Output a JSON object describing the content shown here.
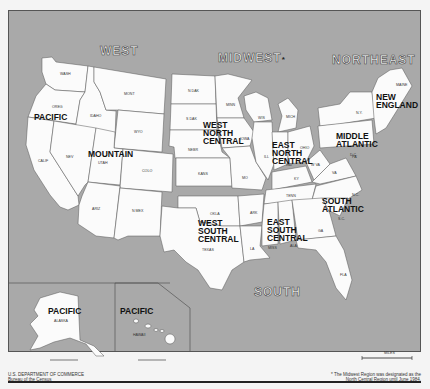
{
  "map": {
    "regions": [
      {
        "name": "WEST"
      },
      {
        "name": "MIDWEST",
        "note_marker": "*"
      },
      {
        "name": "NORTHEAST"
      },
      {
        "name": "SOUTH"
      }
    ],
    "divisions": {
      "pacific": "PACIFIC",
      "mountain": "MOUNTAIN",
      "west_north_central": [
        "WEST",
        "NORTH",
        "CENTRAL"
      ],
      "east_north_central": [
        "EAST",
        "NORTH",
        "CENTRAL"
      ],
      "new_england": [
        "NEW",
        "ENGLAND"
      ],
      "middle_atlantic": [
        "MIDDLE",
        "ATLANTIC"
      ],
      "south_atlantic": [
        "SOUTH",
        "ATLANTIC"
      ],
      "east_south_central": [
        "EAST",
        "SOUTH",
        "CENTRAL"
      ],
      "west_south_central": [
        "WEST",
        "SOUTH",
        "CENTRAL"
      ],
      "pacific_alaska": "PACIFIC",
      "pacific_hawaii": "PACIFIC"
    },
    "states": {
      "wash": "WASH",
      "oreg": "OREG",
      "calif": "CALIF",
      "idaho": "IDAHO",
      "mont": "MONT",
      "wyo": "WYO",
      "nev": "NEV",
      "utah": "UTAH",
      "colo": "COLO",
      "ariz": "ARIZ",
      "nmex": "N MEX",
      "ndak": "N DAK",
      "sdak": "S DAK",
      "nebr": "NEBR",
      "kans": "KANS",
      "minn": "MINN",
      "iowa": "IOWA",
      "mo": "MO",
      "wis": "WIS",
      "mich": "MICH",
      "ill": "ILL",
      "ind": "IND",
      "ohio": "OHIO",
      "ny": "N.Y.",
      "pa": "PA",
      "maine": "MAINE",
      "okla": "OKLA",
      "texas": "TEXAS",
      "ark": "ARK",
      "la": "LA",
      "ky": "KY",
      "tenn": "TENN",
      "miss": "MISS",
      "ala": "ALA",
      "wva": "W VA",
      "va": "VA",
      "nc": "N.C.",
      "sc": "S.C.",
      "ga": "GA",
      "fla": "FLA",
      "dc": "D.C.",
      "alaska": "ALASKA",
      "hawaii": "HAWAII"
    },
    "scale_label": "MILES"
  },
  "footer": {
    "left_line1": "U.S. DEPARTMENT OF COMMERCE",
    "left_line2": "Bureau of the Census",
    "right_line1": "* The Midwest Region was designated as the",
    "right_line2": "North Central Region until June 1984."
  },
  "colors": {
    "water": "#a9a9a9",
    "land": "#fbfbfb",
    "border": "#555555"
  }
}
